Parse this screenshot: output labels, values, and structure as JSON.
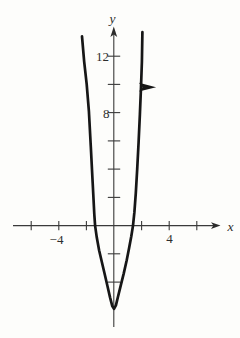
{
  "labels": {
    "y_axis": "y",
    "x_axis": "x",
    "y_tick_12": "12",
    "y_tick_8": "8",
    "x_tick_neg4": "−4",
    "x_tick_4": "4"
  },
  "colors": {
    "ink": "#161616",
    "axis": "#3a3a3a",
    "text": "#2d2d2d",
    "background": "#fdfdfb"
  },
  "chart_data": {
    "type": "line",
    "subtype": "parabola",
    "title": "",
    "xlabel": "x",
    "ylabel": "y",
    "xlim": [
      -7.3,
      7.7
    ],
    "ylim": [
      -7.2,
      14.1
    ],
    "grid": false,
    "x_ticks": [
      -6,
      -4,
      -2,
      2,
      4,
      6
    ],
    "labeled_x_ticks": [
      -4,
      4
    ],
    "y_ticks": [
      -4,
      -2,
      2,
      4,
      6,
      8,
      10,
      12
    ],
    "labeled_y_ticks": [
      8,
      12
    ],
    "vertex": [
      0,
      -5.9
    ],
    "x_intercepts": [
      -1.4,
      1.4
    ],
    "orientation_arrow": {
      "at": [
        1.96,
        9.8
      ],
      "direction": "right"
    },
    "curve_points": [
      [
        -2.32,
        13.4
      ],
      [
        -2.16,
        11.6
      ],
      [
        -1.98,
        10.0
      ],
      [
        -1.82,
        8.1
      ],
      [
        -1.68,
        5.6
      ],
      [
        -1.54,
        3.0
      ],
      [
        -1.43,
        0.8
      ],
      [
        -1.37,
        0.0
      ],
      [
        -1.25,
        -0.85
      ],
      [
        -1.08,
        -1.75
      ],
      [
        -0.88,
        -2.6
      ],
      [
        -0.66,
        -3.5
      ],
      [
        -0.47,
        -4.3
      ],
      [
        -0.28,
        -5.1
      ],
      [
        -0.12,
        -5.7
      ],
      [
        0,
        -5.9
      ],
      [
        0.14,
        -5.65
      ],
      [
        0.3,
        -5.0
      ],
      [
        0.5,
        -4.2
      ],
      [
        0.7,
        -3.4
      ],
      [
        0.92,
        -2.45
      ],
      [
        1.1,
        -1.55
      ],
      [
        1.25,
        -0.75
      ],
      [
        1.38,
        0.0
      ],
      [
        1.48,
        0.95
      ],
      [
        1.58,
        2.3
      ],
      [
        1.68,
        4.0
      ],
      [
        1.78,
        5.9
      ],
      [
        1.88,
        7.9
      ],
      [
        1.96,
        9.8
      ],
      [
        2.02,
        11.6
      ],
      [
        2.06,
        13.7
      ]
    ]
  }
}
